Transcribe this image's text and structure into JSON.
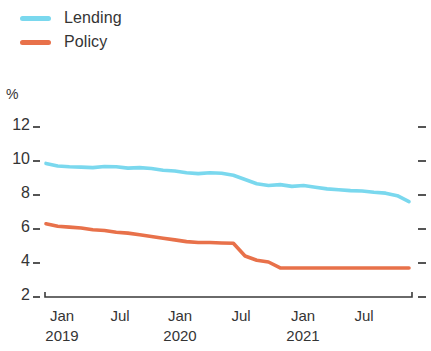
{
  "legend": {
    "position": "top-left",
    "entries": [
      {
        "label": "Lending",
        "color": "#7ad8ee"
      },
      {
        "label": "Policy",
        "color": "#e8714a"
      }
    ]
  },
  "axes": {
    "unit": "%",
    "y_ticks": [
      "12",
      "10",
      "8",
      "6",
      "4",
      "2"
    ],
    "x_ticks": [
      {
        "month": "Jan",
        "year": "2019"
      },
      {
        "month": "Jul",
        "year": ""
      },
      {
        "month": "Jan",
        "year": "2020"
      },
      {
        "month": "Jul",
        "year": ""
      },
      {
        "month": "Jan",
        "year": "2021"
      },
      {
        "month": "Jul",
        "year": ""
      }
    ]
  },
  "chart_data": {
    "type": "line",
    "title": "",
    "subtitle": "",
    "xlabel": "",
    "ylabel": "%",
    "ylim": [
      2,
      12
    ],
    "yticks": [
      2,
      4,
      6,
      8,
      10,
      12
    ],
    "grid": false,
    "legend_position": "top-left",
    "x": [
      "2019-01",
      "2019-02",
      "2019-03",
      "2019-04",
      "2019-05",
      "2019-06",
      "2019-07",
      "2019-08",
      "2019-09",
      "2019-10",
      "2019-11",
      "2019-12",
      "2020-01",
      "2020-02",
      "2020-03",
      "2020-04",
      "2020-05",
      "2020-06",
      "2020-07",
      "2020-08",
      "2020-09",
      "2020-10",
      "2020-11",
      "2020-12",
      "2021-01",
      "2021-02",
      "2021-03",
      "2021-04",
      "2021-05",
      "2021-06",
      "2021-07",
      "2021-08"
    ],
    "x_tick_labels": [
      "Jan 2019",
      "Jul",
      "Jan 2020",
      "Jul",
      "Jan 2021",
      "Jul"
    ],
    "series": [
      {
        "name": "Lending",
        "color": "#7ad8ee",
        "values": [
          9.8,
          9.65,
          9.6,
          9.58,
          9.55,
          9.62,
          9.6,
          9.52,
          9.55,
          9.5,
          9.4,
          9.35,
          9.25,
          9.2,
          9.25,
          9.22,
          9.1,
          8.85,
          8.6,
          8.5,
          8.55,
          8.45,
          8.5,
          8.4,
          8.3,
          8.25,
          8.2,
          8.18,
          8.1,
          8.05,
          7.9,
          7.55
        ]
      },
      {
        "name": "Policy",
        "color": "#e8714a",
        "values": [
          6.25,
          6.1,
          6.05,
          6.0,
          5.9,
          5.85,
          5.75,
          5.7,
          5.6,
          5.5,
          5.4,
          5.3,
          5.2,
          5.15,
          5.15,
          5.12,
          5.1,
          4.35,
          4.1,
          4.0,
          3.65,
          3.65,
          3.65,
          3.65,
          3.65,
          3.65,
          3.65,
          3.65,
          3.65,
          3.65,
          3.65,
          3.65
        ]
      }
    ]
  }
}
